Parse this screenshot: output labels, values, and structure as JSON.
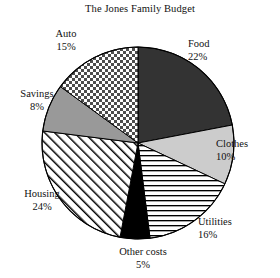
{
  "chart_data": {
    "type": "pie",
    "title": "The Jones Family Budget",
    "xlabel": "",
    "ylabel": "",
    "legend": "none (direct slice labels)",
    "grid": false,
    "start_angle_deg": 0,
    "direction": "clockwise",
    "units": "percent",
    "total": 100,
    "categories": [
      "Food",
      "Clothes",
      "Utilities",
      "Other costs",
      "Housing",
      "Savings",
      "Auto"
    ],
    "values": [
      22,
      10,
      16,
      5,
      24,
      8,
      15
    ],
    "slices": [
      {
        "name": "Food",
        "value": 22,
        "value_label": "22%",
        "fill": "solid-dark",
        "color": "#333333",
        "label_position": "right"
      },
      {
        "name": "Clothes",
        "value": 10,
        "value_label": "10%",
        "fill": "solid-light-gray",
        "color": "#cccccc",
        "label_position": "right"
      },
      {
        "name": "Utilities",
        "value": 16,
        "value_label": "16%",
        "fill": "horizontal-lines",
        "color": "#ffffff",
        "label_position": "bottom-right"
      },
      {
        "name": "Other costs",
        "value": 5,
        "value_label": "5%",
        "fill": "solid-black",
        "color": "#000000",
        "label_position": "bottom"
      },
      {
        "name": "Housing",
        "value": 24,
        "value_label": "24%",
        "fill": "diagonal-hatch",
        "color": "#ffffff",
        "label_position": "left"
      },
      {
        "name": "Savings",
        "value": 8,
        "value_label": "8%",
        "fill": "solid-medium-gray",
        "color": "#999999",
        "label_position": "left"
      },
      {
        "name": "Auto",
        "value": 15,
        "value_label": "15%",
        "fill": "checkerboard",
        "color": "#ffffff",
        "label_position": "top-left"
      }
    ]
  },
  "labels": {
    "food": {
      "name": "Food",
      "pct": "22%"
    },
    "clothes": {
      "name": "Clothes",
      "pct": "10%"
    },
    "utilities": {
      "name": "Utilities",
      "pct": "16%"
    },
    "othercosts": {
      "name": "Other costs",
      "pct": "5%"
    },
    "housing": {
      "name": "Housing",
      "pct": "24%"
    },
    "savings": {
      "name": "Savings",
      "pct": "8%"
    },
    "auto": {
      "name": "Auto",
      "pct": "15%"
    }
  }
}
